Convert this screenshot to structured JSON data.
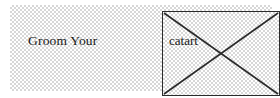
{
  "document": {
    "caption": "Groom Your",
    "background_color": "#ffffff",
    "panel_pattern_color": "#d7d7d7"
  },
  "broken_image": {
    "alt_text": "catart",
    "border_color": "#2b2b2b",
    "cross_color": "#2b2b2b"
  }
}
